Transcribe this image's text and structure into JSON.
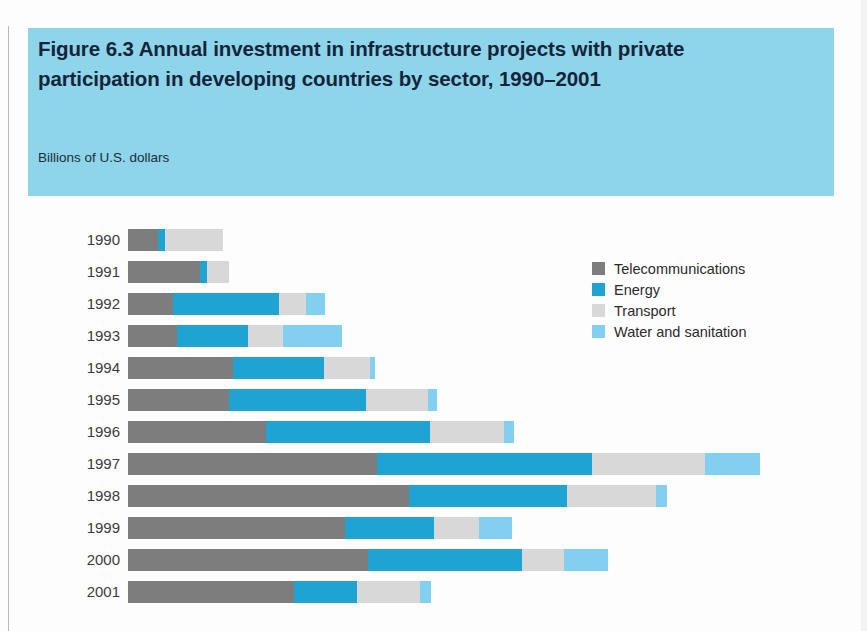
{
  "figure": {
    "title": "Figure 6.3  Annual investment in infrastructure projects with private participation in developing countries by sector, 1990–2001",
    "subtitle": "Billions of U.S. dollars"
  },
  "legend": {
    "items": [
      {
        "label": "Telecommunications",
        "key": "telecom",
        "color": "#7d7d7d"
      },
      {
        "label": "Energy",
        "key": "energy",
        "color": "#1fa3d2"
      },
      {
        "label": "Transport",
        "key": "transport",
        "color": "#d8d8d8"
      },
      {
        "label": "Water and sanitation",
        "key": "water",
        "color": "#82cff0"
      }
    ]
  },
  "colors": {
    "band": "#8ed5ea",
    "title_text": "#14243a",
    "telecom": "#7d7d7d",
    "energy": "#1fa3d2",
    "transport": "#d8d8d8",
    "water": "#82cff0",
    "page": "#fdfdfd"
  },
  "chart_data": {
    "type": "bar",
    "orientation": "horizontal",
    "stacked": true,
    "title": "Figure 6.3  Annual investment in infrastructure projects with private participation in developing countries by sector, 1990–2001",
    "subtitle": "Billions of U.S. dollars",
    "xlabel": "",
    "ylabel": "",
    "grid": false,
    "legend_position": "right",
    "axis_visible": false,
    "units": "Billions of U.S. dollars",
    "categories": [
      "1990",
      "1991",
      "1992",
      "1993",
      "1994",
      "1995",
      "1996",
      "1997",
      "1998",
      "1999",
      "2000",
      "2001"
    ],
    "series": [
      {
        "name": "Telecommunications",
        "color": "#7d7d7d",
        "values": [
          6.2,
          15.0,
          9.3,
          10.2,
          21.8,
          21.0,
          28.8,
          51.8,
          58.6,
          45.2,
          50.0,
          34.6
        ]
      },
      {
        "name": "Energy",
        "color": "#1fa3d2",
        "values": [
          1.5,
          1.5,
          22.1,
          14.7,
          19.0,
          28.5,
          34.1,
          44.9,
          32.8,
          18.5,
          32.1,
          13.1
        ]
      },
      {
        "name": "Transport",
        "color": "#d8d8d8",
        "values": [
          12.1,
          4.6,
          5.6,
          7.4,
          9.7,
          13.1,
          15.5,
          23.6,
          18.7,
          9.5,
          8.7,
          13.1
        ]
      },
      {
        "name": "Water and sanitation",
        "color": "#82cff0",
        "values": [
          0.0,
          0.0,
          4.1,
          12.3,
          1.0,
          1.8,
          2.1,
          11.3,
          2.1,
          6.9,
          9.2,
          2.3
        ]
      }
    ],
    "totals": [
      19.8,
      21.1,
      41.1,
      44.6,
      51.5,
      64.4,
      80.5,
      131.6,
      112.2,
      80.1,
      100.0,
      63.1
    ],
    "xlim": [
      0,
      145
    ]
  }
}
